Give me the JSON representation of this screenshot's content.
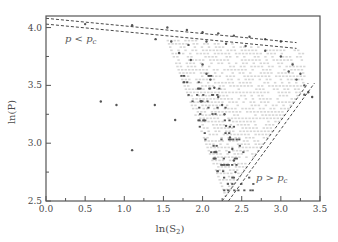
{
  "chart_data": {
    "type": "scatter",
    "title": "",
    "xlabel": "ln(S",
    "xlabel_sub": "2",
    "xlabel_close": ")",
    "ylabel": "ln(P)",
    "xlim": [
      0.0,
      3.5
    ],
    "ylim": [
      2.5,
      4.1
    ],
    "xticks": [
      "0.0",
      "0.5",
      "1.0",
      "1.5",
      "2.0",
      "2.5",
      "3.0",
      "3.5"
    ],
    "yticks": [
      "2.5",
      "3.0",
      "3.5",
      "4.0"
    ],
    "grid": false,
    "legend": null,
    "annotations": [
      {
        "text_main": "p < p",
        "text_sub": "c",
        "x": 0.08,
        "y": 3.95
      },
      {
        "text_main": "p > p",
        "text_sub": "c",
        "x": 2.75,
        "y": 2.68
      }
    ],
    "dashed_lines": [
      {
        "name": "upper-bound-top",
        "points": [
          [
            0.0,
            4.08
          ],
          [
            3.2,
            3.87
          ]
        ]
      },
      {
        "name": "upper-bound-bottom",
        "points": [
          [
            0.0,
            4.03
          ],
          [
            3.2,
            3.82
          ]
        ]
      },
      {
        "name": "right-bound-left",
        "points": [
          [
            2.25,
            2.5
          ],
          [
            3.35,
            3.52
          ]
        ]
      },
      {
        "name": "right-bound-right",
        "points": [
          [
            2.33,
            2.5
          ],
          [
            3.43,
            3.52
          ]
        ]
      }
    ],
    "series": [
      {
        "name": "isolated points",
        "color": "#555555",
        "points": [
          [
            0.7,
            3.36
          ],
          [
            0.9,
            3.33
          ],
          [
            1.39,
            3.33
          ],
          [
            1.65,
            3.2
          ],
          [
            1.1,
            2.94
          ]
        ]
      },
      {
        "name": "boundary points",
        "color": "#555555",
        "points": [
          [
            0.5,
            4.03
          ],
          [
            1.1,
            4.02
          ],
          [
            1.55,
            4.0
          ],
          [
            1.8,
            3.98
          ],
          [
            2.0,
            3.96
          ],
          [
            2.2,
            3.95
          ],
          [
            2.4,
            3.93
          ],
          [
            2.6,
            3.92
          ],
          [
            2.8,
            3.9
          ],
          [
            3.0,
            3.88
          ],
          [
            1.4,
            3.9
          ],
          [
            1.6,
            3.88
          ],
          [
            1.82,
            3.85
          ],
          [
            2.05,
            3.88
          ],
          [
            2.3,
            3.86
          ],
          [
            2.55,
            3.84
          ],
          [
            2.8,
            3.8
          ],
          [
            3.0,
            3.75
          ],
          [
            3.15,
            3.68
          ],
          [
            3.25,
            3.6
          ],
          [
            1.7,
            3.78
          ],
          [
            1.85,
            3.72
          ],
          [
            2.0,
            3.68
          ],
          [
            2.05,
            3.6
          ],
          [
            2.1,
            3.55
          ],
          [
            2.15,
            3.48
          ],
          [
            2.2,
            3.4
          ],
          [
            2.25,
            3.33
          ],
          [
            2.28,
            3.25
          ],
          [
            2.3,
            3.15
          ],
          [
            2.35,
            3.05
          ],
          [
            2.38,
            2.95
          ],
          [
            2.4,
            2.85
          ],
          [
            2.42,
            2.75
          ],
          [
            3.3,
            3.5
          ],
          [
            3.35,
            3.44
          ],
          [
            3.4,
            3.4
          ],
          [
            3.3,
            3.42
          ],
          [
            3.2,
            3.55
          ],
          [
            3.1,
            3.62
          ]
        ]
      },
      {
        "name": "interior (light)",
        "color": "#d6d6d6",
        "region": "triangle between upper dashed band and right dashed band, apex near (2.3, 2.55)"
      }
    ]
  }
}
